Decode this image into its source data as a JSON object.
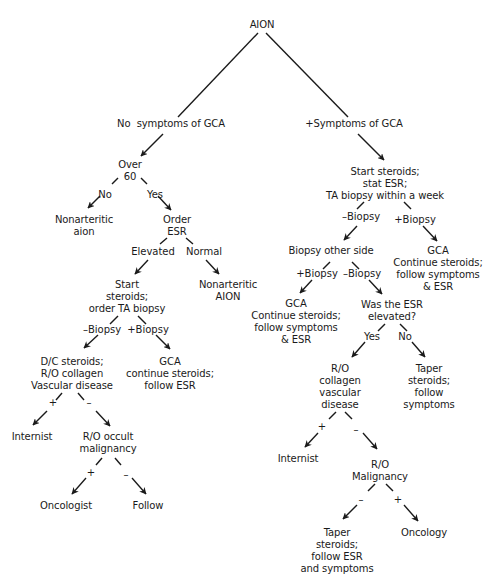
{
  "diagram": {
    "type": "decision-tree",
    "root": "AION",
    "nodes": {
      "root": "AION",
      "no_sym": "No  symptoms of GCA",
      "pos_sym": "+Symptoms of GCA",
      "over60": "Over\n60",
      "nonart_aion_lower": "Nonarteritic\naion",
      "order_esr": "Order\nESR",
      "start_ster_left": "Start\nsteroids;\norder TA biopsy",
      "nonart_AION": "Nonarteritic\nAION",
      "dc_steroids": "D/C steroids;\nR/O collagen\nVascular disease",
      "gca_left": "GCA\ncontinue steroids;\nfollow ESR",
      "internist_left": "Internist",
      "ro_occult": "R/O occult\nmalignancy",
      "oncologist": "Oncologist",
      "follow": "Follow",
      "start_ster_right": "Start steroids;\nstat ESR;\nTA biopsy within a week",
      "biopsy_other": "Biopsy other side",
      "gca_right_top": "GCA\nContinue steroids;\nfollow symptoms\n& ESR",
      "gca_right_mid": "GCA\nContinue steroids;\nfollow symptoms\n& ESR",
      "was_esr": "Was the ESR\nelevated?",
      "ro_collagen": "R/O\ncollagen\nvascular\ndisease",
      "taper_follow_sym": "Taper\nsteroids;\nfollow\nsymptoms",
      "internist_right": "Internist",
      "ro_malignancy": "R/O\nMalignancy",
      "taper_follow_esr": "Taper\nsteroids;\nfollow ESR\nand symptoms",
      "oncology": "Oncology"
    },
    "edge_labels": {
      "no": "No",
      "yes": "Yes",
      "elevated": "Elevated",
      "normal": "Normal",
      "neg_biopsy_left": "–Biopsy",
      "pos_biopsy_left": "+Biopsy",
      "plus_1": "+",
      "minus_1": "–",
      "plus_2": "+",
      "minus_2": "–",
      "neg_biopsy_r1": "–Biopsy",
      "pos_biopsy_r1": "+Biopsy",
      "pos_biopsy_r2": "+Biopsy",
      "neg_biopsy_r2": "–Biopsy",
      "yes_r": "Yes",
      "no_r": "No",
      "plus_r1": "+",
      "minus_r1": "–",
      "minus_r2": "–",
      "plus_r2": "+"
    },
    "colors": {
      "line": "#1a1a1a",
      "background": "#ffffff"
    }
  }
}
